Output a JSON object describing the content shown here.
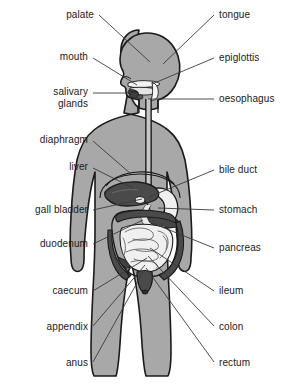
{
  "diagram": {
    "width": 289,
    "height": 392,
    "background_color": "#ffffff",
    "colors": {
      "body_fill": "#a8a8a8",
      "body_stroke": "#1a1a1a",
      "organ_dark": "#4a4a4a",
      "organ_mid": "#6e6e6e",
      "organ_light": "#e8e8e8",
      "organ_white": "#f5f5f5",
      "leader_line": "#3a3a3a",
      "text": "#1a1a1a"
    }
  },
  "labels": [
    {
      "id": "palate",
      "text": "palate",
      "side": "left",
      "text_x": 94,
      "text_y": 15,
      "line": [
        [
          99,
          15
        ],
        [
          150,
          62
        ]
      ]
    },
    {
      "id": "mouth",
      "text": "mouth",
      "side": "left",
      "text_x": 88,
      "text_y": 57,
      "line": [
        [
          93,
          58
        ],
        [
          137,
          85
        ]
      ]
    },
    {
      "id": "salivary-glands",
      "text": "salivary\nglands",
      "side": "left",
      "text_x": 88,
      "text_y": 97,
      "line": [
        [
          93,
          93
        ],
        [
          134,
          93
        ]
      ]
    },
    {
      "id": "diaphragm",
      "text": "diaphragm",
      "side": "left",
      "text_x": 88,
      "text_y": 140,
      "line": [
        [
          93,
          141
        ],
        [
          131,
          174
        ]
      ]
    },
    {
      "id": "liver",
      "text": "liver",
      "side": "left",
      "text_x": 88,
      "text_y": 167,
      "line": [
        [
          93,
          168
        ],
        [
          133,
          188
        ]
      ]
    },
    {
      "id": "gall-bladder",
      "text": "gall bladder",
      "side": "left",
      "text_x": 88,
      "text_y": 210,
      "line": [
        [
          93,
          210
        ],
        [
          142,
          199
        ]
      ]
    },
    {
      "id": "duodenum",
      "text": "duodenum",
      "side": "left",
      "text_x": 88,
      "text_y": 244,
      "line": [
        [
          93,
          244
        ],
        [
          143,
          220
        ]
      ]
    },
    {
      "id": "caecum",
      "text": "caecum",
      "side": "left",
      "text_x": 88,
      "text_y": 291,
      "line": [
        [
          93,
          291
        ],
        [
          147,
          258
        ]
      ]
    },
    {
      "id": "appendix",
      "text": "appendix",
      "side": "left",
      "text_x": 88,
      "text_y": 327,
      "line": [
        [
          93,
          326
        ],
        [
          145,
          265
        ]
      ]
    },
    {
      "id": "anus",
      "text": "anus",
      "side": "left",
      "text_x": 88,
      "text_y": 363,
      "line": [
        [
          93,
          362
        ],
        [
          143,
          272
        ]
      ]
    },
    {
      "id": "tongue",
      "text": "tongue",
      "side": "right",
      "text_x": 219,
      "text_y": 15,
      "line": [
        [
          214,
          15
        ],
        [
          163,
          64
        ]
      ]
    },
    {
      "id": "epiglottis",
      "text": "epiglottis",
      "side": "right",
      "text_x": 219,
      "text_y": 58,
      "line": [
        [
          214,
          58
        ],
        [
          152,
          84
        ]
      ]
    },
    {
      "id": "oesophagus",
      "text": "oesophagus",
      "side": "right",
      "text_x": 219,
      "text_y": 99,
      "line": [
        [
          214,
          99
        ],
        [
          148,
          99
        ]
      ]
    },
    {
      "id": "bile-duct",
      "text": "bile duct",
      "side": "right",
      "text_x": 219,
      "text_y": 170,
      "line": [
        [
          214,
          170
        ],
        [
          149,
          197
        ]
      ]
    },
    {
      "id": "stomach",
      "text": "stomach",
      "side": "right",
      "text_x": 219,
      "text_y": 210,
      "line": [
        [
          214,
          210
        ],
        [
          158,
          208
        ]
      ]
    },
    {
      "id": "pancreas",
      "text": "pancreas",
      "side": "right",
      "text_x": 219,
      "text_y": 248,
      "line": [
        [
          214,
          248
        ],
        [
          152,
          223
        ]
      ]
    },
    {
      "id": "ileum",
      "text": "ileum",
      "side": "right",
      "text_x": 219,
      "text_y": 291,
      "line": [
        [
          214,
          291
        ],
        [
          150,
          248
        ]
      ]
    },
    {
      "id": "colon",
      "text": "colon",
      "side": "right",
      "text_x": 219,
      "text_y": 327,
      "line": [
        [
          214,
          326
        ],
        [
          148,
          256
        ]
      ]
    },
    {
      "id": "rectum",
      "text": "rectum",
      "side": "right",
      "text_x": 219,
      "text_y": 363,
      "line": [
        [
          214,
          362
        ],
        [
          146,
          268
        ]
      ]
    }
  ]
}
